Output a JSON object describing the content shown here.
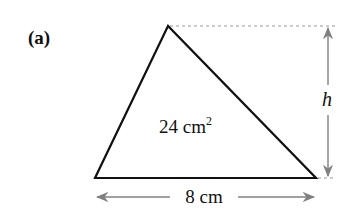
{
  "figure": {
    "part_label": "(a)",
    "shape": "triangle",
    "area": {
      "value": "24",
      "unit": "cm",
      "exponent": "2"
    },
    "base": {
      "label": "8 cm"
    },
    "height": {
      "label": "h"
    },
    "colors": {
      "outline": "#111111",
      "dimension_lines": "#808080",
      "guide_lines": "#9a9a9a",
      "background": "#ffffff"
    }
  }
}
